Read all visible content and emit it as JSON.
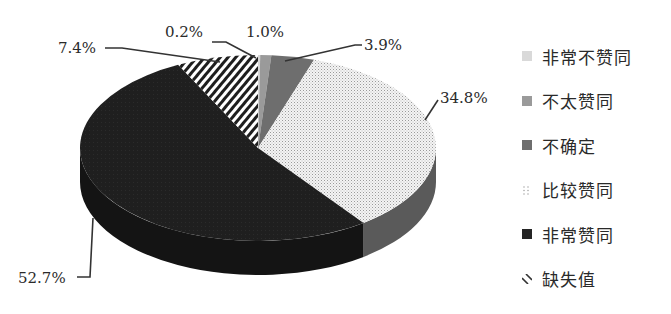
{
  "chart_data": {
    "type": "pie",
    "style": "3d-pie",
    "title": "",
    "start_angle": "12 o'clock",
    "direction": "clockwise",
    "categories": [
      "非常不赞同",
      "不太赞同",
      "不确定",
      "比较赞同",
      "非常赞同",
      "缺失值"
    ],
    "values": [
      0.2,
      1.0,
      3.9,
      34.8,
      52.7,
      7.4
    ],
    "value_labels": [
      "0.2%",
      "1.0%",
      "3.9%",
      "34.8%",
      "52.7%",
      "7.4%"
    ],
    "unit": "%",
    "legend_position": "right",
    "slices": [
      {
        "name": "非常不赞同",
        "value": 0.2,
        "label": "0.2%",
        "color": "#d6d6d6",
        "pattern": "solid"
      },
      {
        "name": "不太赞同",
        "value": 1.0,
        "label": "1.0%",
        "color": "#9a9a9a",
        "pattern": "solid"
      },
      {
        "name": "不确定",
        "value": 3.9,
        "label": "3.9%",
        "color": "#6e6e6e",
        "pattern": "solid"
      },
      {
        "name": "比较赞同",
        "value": 34.8,
        "label": "34.8%",
        "color": "#f2f2f2",
        "pattern": "dots"
      },
      {
        "name": "非常赞同",
        "value": 52.7,
        "label": "52.7%",
        "color": "#1e1e1e",
        "pattern": "solid"
      },
      {
        "name": "缺失值",
        "value": 7.4,
        "label": "7.4%",
        "color": "#ffffff",
        "pattern": "diagonal-stripes"
      }
    ]
  },
  "legend": {
    "items": [
      {
        "label": "非常不赞同"
      },
      {
        "label": "不太赞同"
      },
      {
        "label": "不确定"
      },
      {
        "label": "比较赞同"
      },
      {
        "label": "非常赞同"
      },
      {
        "label": "缺失值"
      }
    ]
  },
  "labels": {
    "l0": "0.2%",
    "l1": "1.0%",
    "l2": "3.9%",
    "l3": "34.8%",
    "l4": "52.7%",
    "l5": "7.4%"
  }
}
